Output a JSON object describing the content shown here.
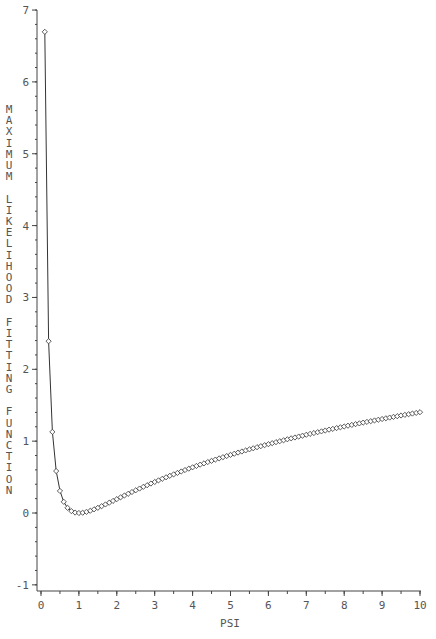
{
  "chart_data": {
    "type": "line",
    "title": "",
    "xlabel": "PSI",
    "ylabel": "MAXIMUM LIKELIHOOD FITTING FUNCTION",
    "xlim": [
      0,
      10
    ],
    "ylim": [
      -1,
      7
    ],
    "x_ticks": [
      0,
      1,
      2,
      3,
      4,
      5,
      6,
      7,
      8,
      9,
      10
    ],
    "y_ticks": [
      -1,
      0,
      1,
      2,
      3,
      4,
      5,
      6,
      7
    ],
    "x_minor_step": 0.5,
    "y_minor_step": 0.2,
    "grid": false,
    "legend": null,
    "marker": "diamond",
    "line_color": "#333333",
    "series": [
      {
        "name": "F(psi)",
        "x": [
          0.1,
          0.2,
          0.3,
          0.4,
          0.5,
          0.6,
          0.7,
          0.8,
          0.9,
          1.0,
          1.1,
          1.2,
          1.3,
          1.4,
          1.5,
          1.6,
          1.7,
          1.8,
          1.9,
          2.0,
          2.1,
          2.2,
          2.3,
          2.4,
          2.5,
          2.6,
          2.7,
          2.8,
          2.9,
          3.0,
          3.1,
          3.2,
          3.3,
          3.4,
          3.5,
          3.6,
          3.7,
          3.8,
          3.9,
          4.0,
          4.1,
          4.2,
          4.3,
          4.4,
          4.5,
          4.6,
          4.7,
          4.8,
          4.9,
          5.0,
          5.1,
          5.2,
          5.3,
          5.4,
          5.5,
          5.6,
          5.7,
          5.8,
          5.9,
          6.0,
          6.1,
          6.2,
          6.3,
          6.4,
          6.5,
          6.6,
          6.7,
          6.8,
          6.9,
          7.0,
          7.1,
          7.2,
          7.3,
          7.4,
          7.5,
          7.6,
          7.7,
          7.8,
          7.9,
          8.0,
          8.1,
          8.2,
          8.3,
          8.4,
          8.5,
          8.6,
          8.7,
          8.8,
          8.9,
          9.0,
          9.1,
          9.2,
          9.3,
          9.4,
          9.5,
          9.6,
          9.7,
          9.8,
          9.9,
          10.0
        ],
        "y": [
          6.697,
          2.391,
          1.129,
          0.584,
          0.307,
          0.156,
          0.072,
          0.027,
          0.006,
          0.0,
          0.004,
          0.016,
          0.031,
          0.051,
          0.072,
          0.095,
          0.119,
          0.143,
          0.168,
          0.193,
          0.218,
          0.243,
          0.267,
          0.292,
          0.316,
          0.34,
          0.364,
          0.387,
          0.41,
          0.432,
          0.454,
          0.476,
          0.497,
          0.518,
          0.538,
          0.558,
          0.578,
          0.598,
          0.617,
          0.636,
          0.655,
          0.673,
          0.691,
          0.709,
          0.726,
          0.743,
          0.76,
          0.777,
          0.793,
          0.809,
          0.825,
          0.841,
          0.856,
          0.871,
          0.886,
          0.901,
          0.916,
          0.93,
          0.944,
          0.958,
          0.972,
          0.986,
          0.999,
          1.012,
          1.026,
          1.039,
          1.051,
          1.064,
          1.076,
          1.089,
          1.101,
          1.113,
          1.125,
          1.136,
          1.148,
          1.16,
          1.171,
          1.182,
          1.193,
          1.204,
          1.215,
          1.226,
          1.237,
          1.247,
          1.258,
          1.268,
          1.278,
          1.288,
          1.298,
          1.308,
          1.318,
          1.328,
          1.338,
          1.347,
          1.357,
          1.366,
          1.375,
          1.384,
          1.393,
          1.403
        ]
      }
    ]
  }
}
